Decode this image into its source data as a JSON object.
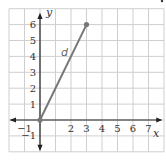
{
  "chart_data": {
    "type": "line",
    "title": "",
    "xlabel": "x",
    "ylabel": "y",
    "xlim": [
      -2,
      8
    ],
    "ylim": [
      -2,
      7
    ],
    "grid": true,
    "x_ticks": [
      "-1",
      "2",
      "3",
      "4",
      "5",
      "6",
      "7"
    ],
    "y_ticks": [
      "-1",
      "1",
      "2",
      "3",
      "4",
      "5",
      "6"
    ],
    "series": [
      {
        "name": "d",
        "points": [
          [
            0,
            0
          ],
          [
            3,
            6
          ]
        ],
        "color": "#777777"
      }
    ],
    "annotations": [
      {
        "text": "d",
        "x": 1.8,
        "y": 4.2
      }
    ]
  },
  "colors": {
    "grid": "#cfcfcf",
    "axis": "#222222",
    "segment": "#777777",
    "point": "#777777"
  }
}
